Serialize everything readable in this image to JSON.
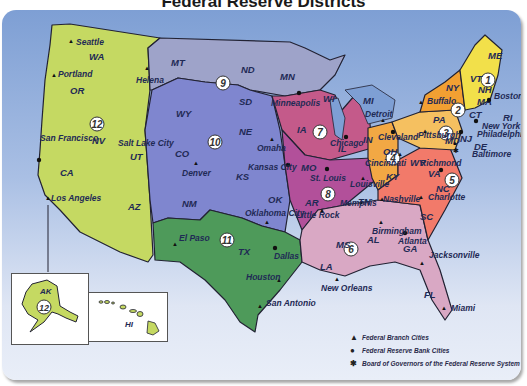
{
  "title": "Federal Reserve Districts",
  "colors": {
    "ocean_top": "#7e9fd4",
    "ocean_bottom": "#e9eef8",
    "district_12": "#c5d962",
    "district_9": "#9ea3c9",
    "district_10": "#7f86cf",
    "district_11": "#4e9a5a",
    "district_7": "#c45a8a",
    "district_8": "#b2509a",
    "district_6": "#d9a8c4",
    "district_5": "#f27a6a",
    "district_4": "#f2a844",
    "district_3": "#f5c060",
    "district_2": "#f2a032",
    "district_1": "#f2e04a"
  },
  "districts": [
    {
      "number": "1"
    },
    {
      "number": "2"
    },
    {
      "number": "3"
    },
    {
      "number": "4"
    },
    {
      "number": "5"
    },
    {
      "number": "6"
    },
    {
      "number": "7"
    },
    {
      "number": "8"
    },
    {
      "number": "9"
    },
    {
      "number": "10"
    },
    {
      "number": "11"
    },
    {
      "number": "12"
    }
  ],
  "states": {
    "WA": "WA",
    "OR": "OR",
    "CA": "CA",
    "NV": "NV",
    "UT": "UT",
    "AZ": "AZ",
    "MT": "MT",
    "WY": "WY",
    "CO": "CO",
    "NM": "NM",
    "ND": "ND",
    "SD": "SD",
    "NE": "NE",
    "KS": "KS",
    "OK": "OK",
    "TX": "TX",
    "MN": "MN",
    "IA": "IA",
    "MO": "MO",
    "AR": "AR",
    "LA": "LA",
    "WI": "WI",
    "IL": "IL",
    "MI": "MI",
    "IN": "IN",
    "OH": "OH",
    "KY": "KY",
    "TN": "TN",
    "MS": "MS",
    "AL": "AL",
    "GA": "GA",
    "FL": "FL",
    "SC": "SC",
    "NC": "NC",
    "VA": "VA",
    "WV": "WV",
    "MD": "MD",
    "DE": "DE",
    "PA": "PA",
    "NJ": "NJ",
    "NY": "NY",
    "CT": "CT",
    "RI": "RI",
    "MA": "MA",
    "VT": "VT",
    "NH": "NH",
    "ME": "ME",
    "AK": "AK",
    "HI": "HI"
  },
  "cities": {
    "seattle": "Seattle",
    "portland": "Portland",
    "san_francisco": "San Francisco",
    "los_angeles": "Los Angeles",
    "salt_lake_city": "Salt Lake City",
    "helena": "Helena",
    "minneapolis": "Minneapolis",
    "denver": "Denver",
    "omaha": "Omaha",
    "kansas_city": "Kansas City",
    "oklahoma_city": "Oklahoma City",
    "el_paso": "El Paso",
    "dallas": "Dallas",
    "houston": "Houston",
    "san_antonio": "San Antonio",
    "chicago": "Chicago",
    "detroit": "Detroit",
    "st_louis": "St. Louis",
    "little_rock": "Little Rock",
    "memphis": "Memphis",
    "louisville": "Louisville",
    "nashville": "Nashville",
    "birmingham": "Birmingham",
    "atlanta": "Atlanta",
    "new_orleans": "New Orleans",
    "jacksonville": "Jacksonville",
    "miami": "Miami",
    "cleveland": "Cleveland",
    "cincinnati": "Cincinnati",
    "pittsburgh": "Pittsburgh",
    "richmond": "Richmond",
    "charlotte": "Charlotte",
    "baltimore": "Baltimore",
    "philadelphia": "Philadelphia",
    "new_york": "New York",
    "buffalo": "Buffalo",
    "boston": "Boston"
  },
  "legend": {
    "items": [
      {
        "symbol": "▲",
        "label": "Federal Branch Cities"
      },
      {
        "symbol": "●",
        "label": "Federal Reserve Bank Cities"
      },
      {
        "symbol": "✱",
        "label": "Board of Governors of the Federal Reserve System"
      }
    ]
  }
}
